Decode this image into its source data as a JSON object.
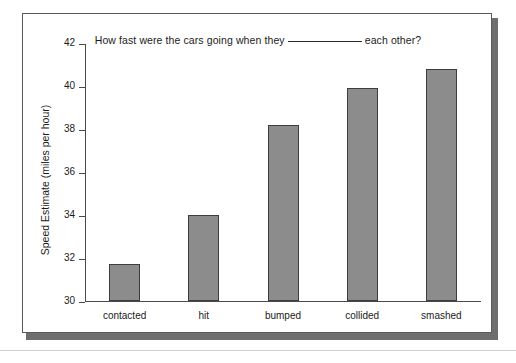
{
  "chart_data": {
    "type": "bar",
    "title_parts": {
      "before_blank": "How fast were the cars going when they",
      "after_blank": "each other?"
    },
    "categories": [
      "contacted",
      "hit",
      "bumped",
      "collided",
      "smashed"
    ],
    "values": [
      31.7,
      34.0,
      38.2,
      39.9,
      40.8
    ],
    "xlabel": "",
    "ylabel": "Speed Estimate (miles per hour)",
    "ylim": [
      30,
      42
    ],
    "ytick_labels": [
      "42",
      "40",
      "38",
      "36",
      "34",
      "32",
      "30"
    ],
    "ytick_values": [
      42,
      40,
      38,
      36,
      34,
      32,
      30
    ],
    "ytick_step": 2,
    "grid": false,
    "legend": null,
    "bar_color": "#8c8c8c",
    "bar_border_color": "#3d3d3d",
    "axis_color": "#4a4a4a",
    "text_color": "#1b1b1b",
    "background": "#ffffff"
  }
}
